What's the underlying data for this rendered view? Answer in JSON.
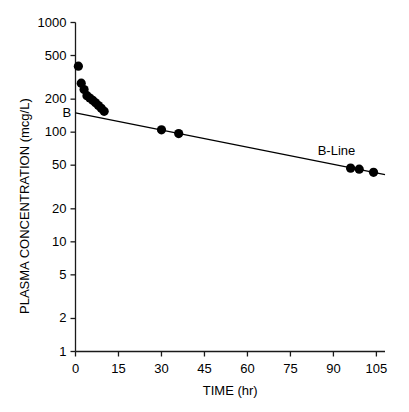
{
  "chart_data": {
    "type": "scatter",
    "title": "",
    "xlabel": "TIME (hr)",
    "ylabel": "PLASMA CONCENTRATION (mcg/L)",
    "yscale": "log",
    "xscale": "linear",
    "xlim": [
      0,
      108
    ],
    "ylim": [
      1,
      1000
    ],
    "xticks": [
      0,
      15,
      30,
      45,
      60,
      75,
      90,
      105
    ],
    "xtick_labels": [
      "0",
      "15",
      "30",
      "45",
      "60",
      "75",
      "90",
      "105"
    ],
    "yticks": [
      1,
      2,
      5,
      10,
      20,
      50,
      100,
      200,
      500,
      1000
    ],
    "ytick_labels": [
      "1",
      "2",
      "5",
      "10",
      "20",
      "50",
      "100",
      "200",
      "500",
      "1000"
    ],
    "grid": false,
    "legend": false,
    "series": [
      {
        "name": "Plasma concentration data",
        "type": "scatter",
        "marker": "filled-circle",
        "color": "#000000",
        "points": [
          {
            "x": 1.0,
            "y": 400
          },
          {
            "x": 2.0,
            "y": 280
          },
          {
            "x": 3.0,
            "y": 245
          },
          {
            "x": 4.0,
            "y": 215
          },
          {
            "x": 5.0,
            "y": 205
          },
          {
            "x": 6.0,
            "y": 195
          },
          {
            "x": 7.0,
            "y": 185
          },
          {
            "x": 8.0,
            "y": 175
          },
          {
            "x": 9.0,
            "y": 165
          },
          {
            "x": 10.0,
            "y": 155
          },
          {
            "x": 30.0,
            "y": 105
          },
          {
            "x": 36.0,
            "y": 97
          },
          {
            "x": 96.0,
            "y": 47
          },
          {
            "x": 99.0,
            "y": 46
          },
          {
            "x": 104.0,
            "y": 43
          }
        ]
      },
      {
        "name": "B-Line",
        "type": "line",
        "color": "#000000",
        "intercept_label": "B",
        "intercept_value": 150,
        "endpoints": [
          {
            "x": 0.0,
            "y": 150
          },
          {
            "x": 108.0,
            "y": 41
          }
        ]
      }
    ],
    "annotations": [
      {
        "text": "B",
        "x": 0.0,
        "y": 150,
        "position": "left-of-axis"
      },
      {
        "text": "B-Line",
        "x": 88.0,
        "y": 68,
        "position": "above-line"
      }
    ]
  },
  "axis": {
    "x_title": "TIME (hr)",
    "y_title": "PLASMA CONCENTRATION (mcg/L)"
  },
  "labels": {
    "y": [
      "1000",
      "500",
      "200",
      "100",
      "50",
      "20",
      "10",
      "5",
      "2",
      "1"
    ],
    "x": [
      "0",
      "15",
      "30",
      "45",
      "60",
      "75",
      "90",
      "105"
    ],
    "intercept": "B",
    "line_name": "B-Line"
  }
}
